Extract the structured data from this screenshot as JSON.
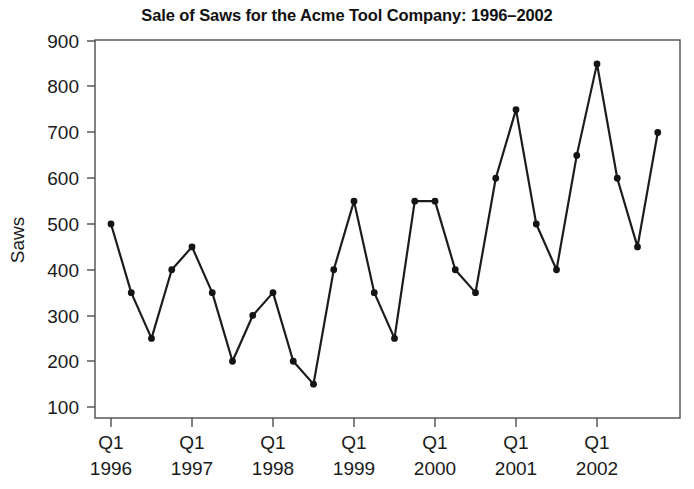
{
  "chart_data": {
    "type": "line",
    "title": "Sale of Saws for the Acme Tool Company: 1996–2002",
    "xlabel": "",
    "ylabel": "Saws",
    "ylim": [
      100,
      900
    ],
    "yticks": [
      100,
      200,
      300,
      400,
      500,
      600,
      700,
      800,
      900
    ],
    "ytick_labels": [
      "100",
      "200",
      "300",
      "400",
      "500",
      "600",
      "700",
      "800",
      "900"
    ],
    "grid": false,
    "legend": null,
    "xtick_labels": [
      {
        "quarter": "Q1",
        "year": "1996"
      },
      {
        "quarter": "Q1",
        "year": "1997"
      },
      {
        "quarter": "Q1",
        "year": "1998"
      },
      {
        "quarter": "Q1",
        "year": "1999"
      },
      {
        "quarter": "Q1",
        "year": "2000"
      },
      {
        "quarter": "Q1",
        "year": "2001"
      },
      {
        "quarter": "Q1",
        "year": "2002"
      }
    ],
    "x": [
      "Q1 1996",
      "Q2 1996",
      "Q3 1996",
      "Q4 1996",
      "Q1 1997",
      "Q2 1997",
      "Q3 1997",
      "Q4 1997",
      "Q1 1998",
      "Q2 1998",
      "Q3 1998",
      "Q4 1998",
      "Q1 1999",
      "Q2 1999",
      "Q3 1999",
      "Q4 1999",
      "Q1 2000",
      "Q2 2000",
      "Q3 2000",
      "Q4 2000",
      "Q1 2001",
      "Q2 2001",
      "Q3 2001",
      "Q4 2001",
      "Q1 2002",
      "Q2 2002",
      "Q3 2002",
      "Q4 2002"
    ],
    "values": [
      500,
      350,
      250,
      400,
      450,
      350,
      200,
      300,
      350,
      200,
      150,
      400,
      550,
      350,
      250,
      550,
      550,
      400,
      350,
      600,
      750,
      500,
      400,
      650,
      850,
      600,
      450,
      700
    ],
    "series": [
      {
        "name": "Saws",
        "color": "#1c1c1c",
        "marker": "filled-circle",
        "values": [
          500,
          350,
          250,
          400,
          450,
          350,
          200,
          300,
          350,
          200,
          150,
          400,
          550,
          350,
          250,
          550,
          550,
          400,
          350,
          600,
          750,
          500,
          400,
          650,
          850,
          600,
          450,
          700
        ]
      }
    ]
  },
  "colors": {
    "line": "#1c1c1c",
    "marker": "#141414",
    "frame": "#4d4d4d",
    "text": "#1a1a1a",
    "background": "#ffffff"
  }
}
